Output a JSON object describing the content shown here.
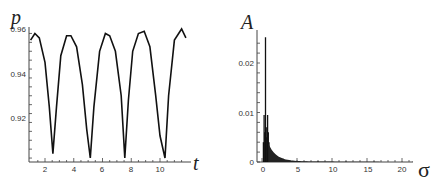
{
  "chart_data": [
    {
      "type": "line",
      "title": "",
      "xlabel": "t",
      "ylabel": "p",
      "xlim": [
        1,
        12
      ],
      "ylim": [
        0.9,
        0.96
      ],
      "x_ticks": [
        "2",
        "4",
        "6",
        "8",
        "10"
      ],
      "y_ticks": [
        "0.92",
        "0.94",
        "0.96"
      ],
      "grid": false,
      "legend": null,
      "description": "Periodic oscillation with period ~2.6; peaks ~0.957-0.959, sharp minima ~0.902-0.904",
      "series": [
        {
          "name": "p(t)",
          "x": [
            1.0,
            1.3,
            1.6,
            2.0,
            2.3,
            2.55,
            2.8,
            3.1,
            3.5,
            3.8,
            4.2,
            4.6,
            4.9,
            5.15,
            5.4,
            5.8,
            6.2,
            6.5,
            6.9,
            7.3,
            7.55,
            7.8,
            8.1,
            8.5,
            8.9,
            9.3,
            9.7,
            10.0,
            10.35,
            10.6,
            11.0,
            11.5,
            11.8
          ],
          "y": [
            0.955,
            0.958,
            0.956,
            0.945,
            0.925,
            0.904,
            0.925,
            0.948,
            0.957,
            0.957,
            0.952,
            0.935,
            0.915,
            0.902,
            0.925,
            0.95,
            0.958,
            0.957,
            0.95,
            0.93,
            0.902,
            0.928,
            0.95,
            0.958,
            0.959,
            0.952,
            0.93,
            0.912,
            0.902,
            0.93,
            0.955,
            0.96,
            0.956
          ]
        }
      ]
    },
    {
      "type": "line",
      "title": "",
      "xlabel": "σ",
      "ylabel": "A",
      "xlim": [
        -0.5,
        22
      ],
      "ylim": [
        0,
        0.026
      ],
      "x_ticks": [
        "0",
        "5",
        "10",
        "15",
        "20"
      ],
      "y_ticks": [
        "0",
        "0.01",
        "0.02"
      ],
      "grid": false,
      "legend": null,
      "description": "Amplitude spectrum: dominant peak ~0.025 at σ≈0.5, secondary peaks ~0.0095 near σ≈0.3 and σ≈0.8, rapidly decaying tail to ~0 beyond σ≈5",
      "series": [
        {
          "name": "A(σ)",
          "x": [
            0.0,
            0.2,
            0.3,
            0.4,
            0.5,
            0.6,
            0.7,
            0.8,
            0.9,
            1.0,
            1.2,
            1.5,
            2.0,
            3.0,
            5.0,
            8.0,
            12.0,
            16.0,
            20.0,
            21.5
          ],
          "y": [
            0.0,
            0.004,
            0.0095,
            0.006,
            0.0252,
            0.007,
            0.005,
            0.0095,
            0.006,
            0.004,
            0.0025,
            0.0018,
            0.0012,
            0.0007,
            0.0003,
            0.00015,
            0.0001,
            7e-05,
            5e-05,
            4e-05
          ]
        }
      ]
    }
  ]
}
